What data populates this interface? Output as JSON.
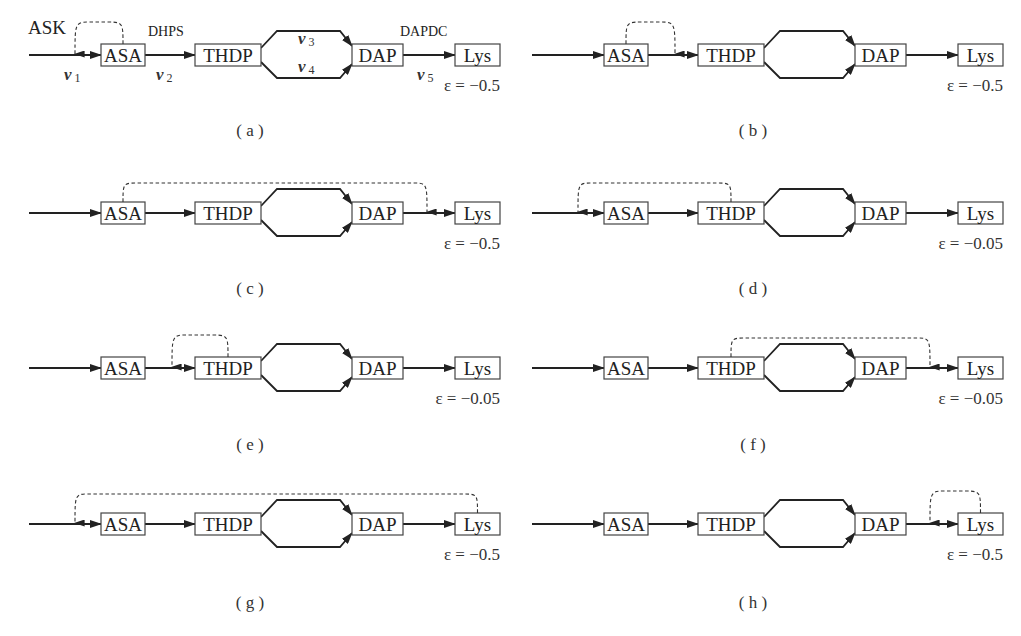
{
  "figure": {
    "nodes": [
      "ASA",
      "THDP",
      "DAP",
      "Lys"
    ],
    "enzymes": {
      "ask": "ASK",
      "dhps": "DHPS",
      "dapdc": "DAPDC"
    },
    "fluxes": [
      {
        "base": "v",
        "sub": "1"
      },
      {
        "base": "v",
        "sub": "2"
      },
      {
        "base": "v",
        "sub": "3"
      },
      {
        "base": "v",
        "sub": "4"
      },
      {
        "base": "v",
        "sub": "5"
      }
    ],
    "colors": {
      "line": "#222222",
      "box_stroke": "#444444",
      "background": "#ffffff"
    }
  },
  "panels": [
    {
      "label": "( a )",
      "epsilon": "ε = −0.5",
      "feedback_from": "ASA",
      "feedback_to": "v1",
      "annotated": true
    },
    {
      "label": "( b )",
      "epsilon": "ε = −0.5",
      "feedback_from": "ASA",
      "feedback_to": "v2",
      "annotated": false
    },
    {
      "label": "( c )",
      "epsilon": "ε = −0.5",
      "feedback_from": "ASA",
      "feedback_to": "v5",
      "annotated": false
    },
    {
      "label": "( d )",
      "epsilon": "ε = −0.05",
      "feedback_from": "THDP",
      "feedback_to": "v1",
      "annotated": false
    },
    {
      "label": "( e )",
      "epsilon": "ε = −0.05",
      "feedback_from": "THDP",
      "feedback_to": "v2",
      "annotated": false
    },
    {
      "label": "( f )",
      "epsilon": "ε = −0.05",
      "feedback_from": "THDP",
      "feedback_to": "v5",
      "annotated": false
    },
    {
      "label": "( g )",
      "epsilon": "ε = −0.5",
      "feedback_from": "Lys",
      "feedback_to": "v1",
      "annotated": false
    },
    {
      "label": "( h )",
      "epsilon": "ε = −0.5",
      "feedback_from": "Lys",
      "feedback_to": "v5",
      "annotated": false
    }
  ]
}
